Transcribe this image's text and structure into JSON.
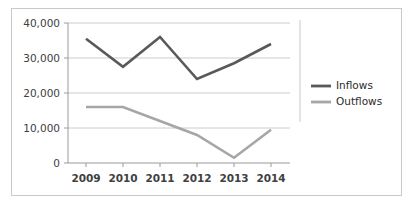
{
  "chart_data": {
    "type": "line",
    "title": "",
    "subtitle": "",
    "xlabel": "",
    "ylabel": "",
    "categories": [
      "2009",
      "2010",
      "2011",
      "2012",
      "2013",
      "2014"
    ],
    "series": [
      {
        "name": "Inflows",
        "color": "#595959",
        "values": [
          35500,
          27500,
          36000,
          24000,
          28500,
          34000
        ]
      },
      {
        "name": "Outflows",
        "color": "#a6a6a6",
        "values": [
          16000,
          16000,
          12000,
          8000,
          1500,
          9500
        ]
      }
    ],
    "ylim": [
      0,
      40000
    ],
    "y_ticks": [
      0,
      10000,
      20000,
      30000,
      40000
    ],
    "y_tick_labels": [
      "0",
      "10,000",
      "20,000",
      "30,000",
      "40,000"
    ],
    "x_tick_labels": [
      "2009",
      "2010",
      "2011",
      "2012",
      "2013",
      "2014"
    ],
    "grid": "horizontal",
    "legend_position": "right",
    "legend_entries": [
      "Inflows",
      "Outflows"
    ]
  },
  "colors": {
    "inflows": "#595959",
    "outflows": "#a6a6a6",
    "gridline": "#bfbfbf",
    "axis": "#9a9a9a",
    "frame_border": "#c9c9c9",
    "background": "#ffffff",
    "tick_text": "#404040",
    "legend_text": "#2b2b2b"
  },
  "legend": {
    "items": [
      {
        "label": "Inflows",
        "color": "#595959"
      },
      {
        "label": "Outflows",
        "color": "#a6a6a6"
      }
    ]
  },
  "axes": {
    "y_labels": [
      "40,000",
      "30,000",
      "20,000",
      "10,000",
      "0"
    ],
    "x_labels": [
      "2009",
      "2010",
      "2011",
      "2012",
      "2013",
      "2014"
    ]
  }
}
